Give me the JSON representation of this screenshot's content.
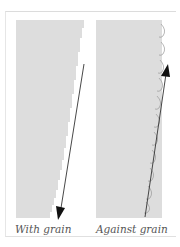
{
  "diagram": {
    "title": "",
    "panels": [
      {
        "id": "with-grain",
        "label": "With grain",
        "arrow_direction": "down"
      },
      {
        "id": "against-grain",
        "label": "Against grain",
        "arrow_direction": "up"
      }
    ],
    "colors": {
      "grain_lines": "#a8a8a8",
      "arrow": "#222222",
      "frame": "#dcdcdc",
      "label": "#555555"
    }
  }
}
